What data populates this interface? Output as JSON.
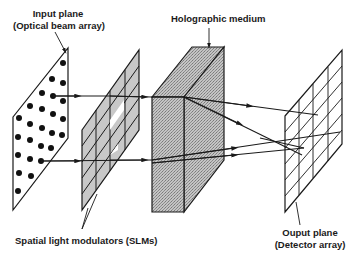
{
  "figure": {
    "type": "schematic",
    "colors": {
      "line": "#1a1a1a",
      "fill_slm": "#c8c8c8",
      "fill_medium": "#b0b0b0",
      "background": "#ffffff"
    }
  },
  "labels": {
    "input_plane": {
      "line1": "Input plane",
      "line2": "(Optical beam array)"
    },
    "holographic_medium": "Holographic medium",
    "slms": "Spatial light modulators (SLMs)",
    "output_plane": {
      "line1": "Ouput plane",
      "line2": "(Detector array)"
    }
  },
  "components": [
    {
      "id": "input-plane",
      "name": "Input plane",
      "description": "Optical beam array of dots"
    },
    {
      "id": "slm",
      "name": "Spatial light modulators",
      "grid": "4 columns x 5 rows"
    },
    {
      "id": "holographic-medium",
      "name": "Holographic medium",
      "shape": "shaded 3D block"
    },
    {
      "id": "output-plane",
      "name": "Output plane",
      "description": "Detector array grid"
    }
  ]
}
